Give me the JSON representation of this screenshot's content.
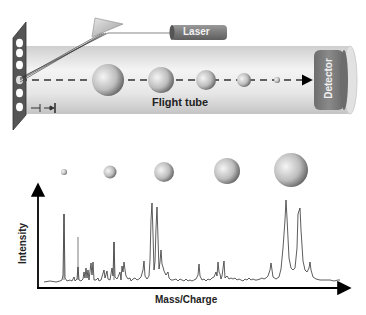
{
  "diagram": {
    "top_panel": {
      "laser_label": "Laser",
      "tube_label": "Flight tube",
      "detector_label": "Detector",
      "sample_plate_holes": 6,
      "tube_ions": [
        {
          "cx": 108,
          "r": 16
        },
        {
          "cx": 161,
          "r": 13
        },
        {
          "cx": 206,
          "r": 10
        },
        {
          "cx": 244,
          "r": 7
        },
        {
          "cx": 277,
          "r": 3
        }
      ]
    },
    "bottom_panel": {
      "x_axis_label": "Mass/Charge",
      "y_axis_label": "Intensity",
      "ion_markers": [
        {
          "cx": 64,
          "r": 3
        },
        {
          "cx": 110,
          "r": 6
        },
        {
          "cx": 164,
          "r": 10
        },
        {
          "cx": 227,
          "r": 13
        },
        {
          "cx": 291,
          "r": 17
        }
      ]
    },
    "colors": {
      "plate": "#555555",
      "tube_light": "#f2f2f2",
      "tube_dark": "#c8c8c8",
      "laser_body": "#7a7a7a",
      "detector": "#7d7d7d",
      "spectrum_line": "#333333",
      "axis": "#000000"
    }
  }
}
